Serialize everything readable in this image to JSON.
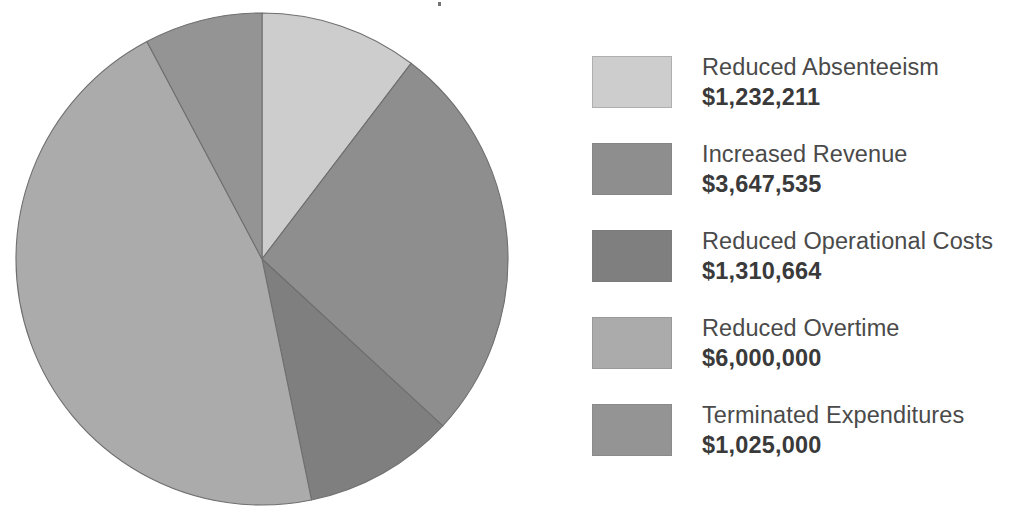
{
  "chart_data": {
    "type": "pie",
    "title": "",
    "subtitle": "",
    "xlabel": "",
    "ylabel": "",
    "legend_position": "right",
    "grid": false,
    "value_prefix": "$",
    "start_angle_deg": 0,
    "direction": "clockwise",
    "categories": [
      "Reduced Absenteeism",
      "Increased Revenue",
      "Reduced Operational Costs",
      "Reduced Overtime",
      "Terminated Expenditures"
    ],
    "values": [
      1232211,
      3647535,
      1310664,
      6000000,
      1025000
    ],
    "value_labels": [
      "$1,232,211",
      "$3,647,535",
      "$1,310,664",
      "$6,000,000",
      "$1,025,000"
    ],
    "colors": [
      "#cdcdcd",
      "#8e8e8e",
      "#7f7f7f",
      "#ababab",
      "#949494"
    ],
    "total": 13215410,
    "slices": [
      {
        "label": "Reduced Absenteeism",
        "value": 1232211,
        "value_label": "$1,232,211",
        "color": "#cdcdcd",
        "start_deg": 0.0,
        "end_deg": 37.3
      },
      {
        "label": "Increased Revenue",
        "value": 3647535,
        "value_label": "$3,647,535",
        "color": "#8e8e8e",
        "start_deg": 37.3,
        "end_deg": 132.7
      },
      {
        "label": "Reduced Operational Costs",
        "value": 1310664,
        "value_label": "$1,310,664",
        "color": "#7f7f7f",
        "start_deg": 132.7,
        "end_deg": 168.4
      },
      {
        "label": "Reduced Overtime",
        "value": 6000000,
        "value_label": "$6,000,000",
        "color": "#ababab",
        "start_deg": 168.4,
        "end_deg": 332.1
      },
      {
        "label": "Terminated Expenditures",
        "value": 1025000,
        "value_label": "$1,025,000",
        "color": "#949494",
        "start_deg": 332.1,
        "end_deg": 360.0
      }
    ]
  },
  "pie": {
    "center_x": 262,
    "center_y": 259,
    "radius": 246,
    "stroke_color": "#6f6f6f"
  },
  "legend": {
    "items": [
      {
        "label": "Reduced Absenteeism",
        "value": "$1,232,211",
        "color": "#cdcdcd"
      },
      {
        "label": "Increased Revenue",
        "value": "$3,647,535",
        "color": "#8e8e8e"
      },
      {
        "label": "Reduced Operational Costs",
        "value": "$1,310,664",
        "color": "#7f7f7f"
      },
      {
        "label": "Reduced Overtime",
        "value": "$6,000,000",
        "color": "#ababab"
      },
      {
        "label": "Terminated Expenditures",
        "value": "$1,025,000",
        "color": "#949494"
      }
    ]
  }
}
